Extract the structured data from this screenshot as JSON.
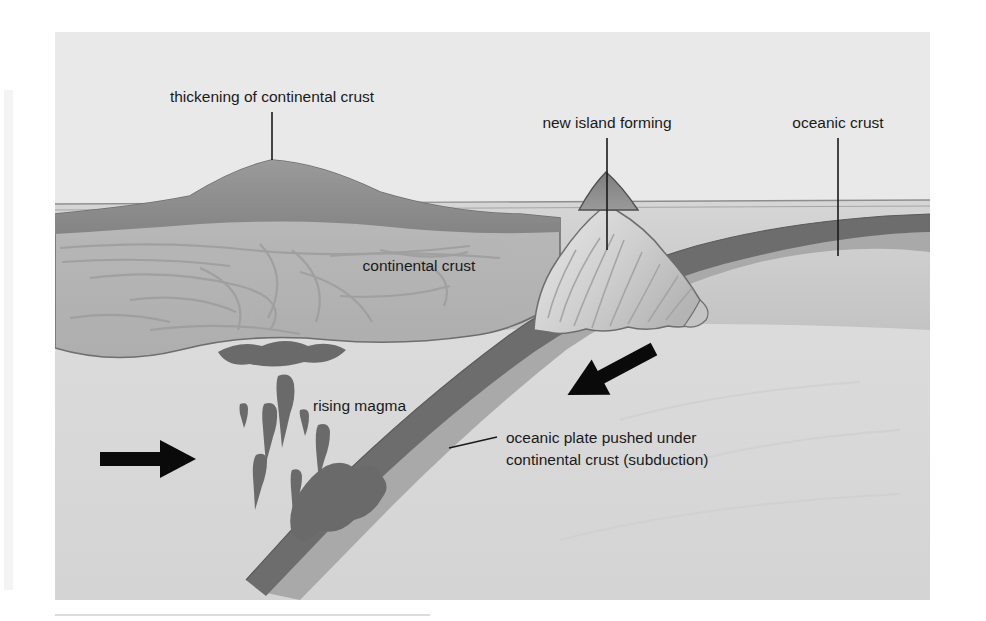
{
  "figure": {
    "kind": "geological-cross-section-diagram",
    "canvas": {
      "width": 986,
      "height": 621
    },
    "frame": {
      "x": 55,
      "y": 32,
      "width": 875,
      "height": 568
    }
  },
  "labels": {
    "thickening": "thickening of continental crust",
    "new_island": "new island forming",
    "oceanic_crust": "oceanic crust",
    "continental_crust": "continental crust",
    "rising_magma": "rising magma",
    "subduction_line1": "oceanic plate pushed under",
    "subduction_line2": "continental crust (subduction)"
  },
  "annotations": {
    "arrow_left_name": "convergence-arrow-right-pointing",
    "arrow_right_name": "convergence-arrow-left-pointing",
    "arrow_left_direction": "right",
    "arrow_right_direction": "down-left"
  },
  "colors": {
    "page_background": "#ffffff",
    "mantle_background": "#dcdcdc",
    "water": "#c9c9c9",
    "sky_band": "#d2d2d2",
    "continental_crust": "#b5b5b5",
    "continental_topsoil": "#8f8f8f",
    "continental_outline": "#6e6e6e",
    "oceanic_slab_dark": "#6f6f6f",
    "oceanic_slab_light": "#a8a8a8",
    "island_light": "#e2e2e2",
    "island_mid": "#bdbdbd",
    "island_peak": "#8c8c8c",
    "magma": "#6a6a6a",
    "label_text": "#1a1a1a",
    "leader_line": "#1a1a1a",
    "arrow": "#0a0a0a",
    "footer_rule": "#d8d8d8"
  },
  "geometry": {
    "sea_level_y": 207,
    "slab_dip_degrees": 34,
    "island_peak_x": 607,
    "mountain_peak_x": 272
  }
}
